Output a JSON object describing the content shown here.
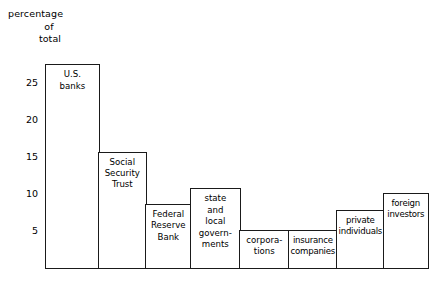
{
  "axis_caption": {
    "line1": "percentage",
    "line2": "of",
    "line3": "total"
  },
  "chart_data": {
    "type": "bar",
    "title": "",
    "subtitle": "",
    "xlabel": "",
    "ylabel": "percentage of total",
    "ylim": [
      0,
      28
    ],
    "grid": false,
    "legend": null,
    "y_ticks": [
      5,
      10,
      15,
      20,
      25
    ],
    "y_tick_labels": [
      "5",
      "10",
      "15",
      "20",
      "25"
    ],
    "categories": [
      "U.S. banks",
      "Social Security Trust",
      "Federal Reserve Bank",
      "state and local governments",
      "corporations",
      "insurance companies",
      "private individuals",
      "foreign investors"
    ],
    "values": [
      27.5,
      15.7,
      8.6,
      10.7,
      5.1,
      5.1,
      7.8,
      10.1
    ],
    "bars": [
      {
        "label": "U.S. banks",
        "value": 27.5,
        "label_lines": [
          "U.S.",
          "banks"
        ],
        "x_left": 0,
        "x_right": 53
      },
      {
        "label": "Social Security Trust",
        "value": 15.7,
        "label_lines": [
          "Social",
          "Security",
          "Trust"
        ],
        "x_left": 53,
        "x_right": 100
      },
      {
        "label": "Federal Reserve Bank",
        "value": 8.6,
        "label_lines": [
          "Federal",
          "Reserve",
          "Bank"
        ],
        "x_left": 100,
        "x_right": 145
      },
      {
        "label": "state and local governments",
        "value": 10.7,
        "label_lines": [
          "state",
          "and",
          "local",
          "govern-",
          "ments"
        ],
        "x_left": 145,
        "x_right": 194
      },
      {
        "label": "corporations",
        "value": 5.1,
        "label_lines": [
          "corpora-",
          "tions"
        ],
        "x_left": 194,
        "x_right": 243
      },
      {
        "label": "insurance companies",
        "value": 5.1,
        "label_lines": [
          "insurance",
          "companies"
        ],
        "x_left": 243,
        "x_right": 291
      },
      {
        "label": "private individuals",
        "value": 7.8,
        "label_lines": [
          "private",
          "individuals"
        ],
        "x_left": 291,
        "x_right": 338
      },
      {
        "label": "foreign investors",
        "value": 10.1,
        "label_lines": [
          "foreign",
          "investors"
        ],
        "x_left": 338,
        "x_right": 382
      }
    ],
    "colors": {
      "background": "#ffffff",
      "bar_fill": "#ffffff",
      "bar_stroke": "#1a1a1a",
      "axis": "#1a1a1a",
      "text": "#000000"
    }
  }
}
